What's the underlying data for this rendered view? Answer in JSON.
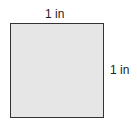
{
  "diagram": {
    "shape": "square",
    "fill_color": "#e6e6e6",
    "stroke_color": "#333333",
    "top_label": "1 in",
    "right_label": "1 in"
  }
}
